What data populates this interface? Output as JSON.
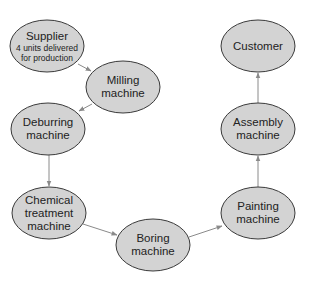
{
  "diagram": {
    "nodes": [
      {
        "id": "supplier",
        "cx": 47,
        "cy": 46,
        "lines": [
          "Supplier"
        ],
        "sub": [
          "4 units delivered",
          "for production"
        ]
      },
      {
        "id": "milling",
        "cx": 123,
        "cy": 87,
        "lines": [
          "Milling",
          "machine"
        ]
      },
      {
        "id": "deburring",
        "cx": 48,
        "cy": 129,
        "lines": [
          "Deburring",
          "machine"
        ]
      },
      {
        "id": "chemical",
        "cx": 49,
        "cy": 213,
        "lines": [
          "Chemical",
          "treatment",
          "machine"
        ]
      },
      {
        "id": "boring",
        "cx": 153,
        "cy": 245,
        "lines": [
          "Boring",
          "machine"
        ]
      },
      {
        "id": "painting",
        "cx": 258,
        "cy": 213,
        "lines": [
          "Painting",
          "machine"
        ]
      },
      {
        "id": "assembly",
        "cx": 258,
        "cy": 129,
        "lines": [
          "Assembly",
          "machine"
        ]
      },
      {
        "id": "customer",
        "cx": 258,
        "cy": 46,
        "lines": [
          "Customer"
        ]
      }
    ],
    "edges": [
      {
        "from": "supplier",
        "to": "milling",
        "x1": 78,
        "y1": 64,
        "x2": 91,
        "y2": 71
      },
      {
        "from": "milling",
        "to": "deburring",
        "x1": 92,
        "y1": 104,
        "x2": 79,
        "y2": 111
      },
      {
        "from": "deburring",
        "to": "chemical",
        "x1": 49,
        "y1": 155,
        "x2": 49,
        "y2": 186
      },
      {
        "from": "chemical",
        "to": "boring",
        "x1": 83,
        "y1": 224,
        "x2": 117,
        "y2": 235
      },
      {
        "from": "boring",
        "to": "painting",
        "x1": 189,
        "y1": 237,
        "x2": 222,
        "y2": 226
      },
      {
        "from": "painting",
        "to": "assembly",
        "x1": 258,
        "y1": 187,
        "x2": 258,
        "y2": 156
      },
      {
        "from": "assembly",
        "to": "customer",
        "x1": 258,
        "y1": 103,
        "x2": 258,
        "y2": 73
      }
    ],
    "colors": {
      "fill": "#d3d3d3",
      "stroke": "#3a3a3a",
      "arrow": "#8a8a8a"
    }
  }
}
